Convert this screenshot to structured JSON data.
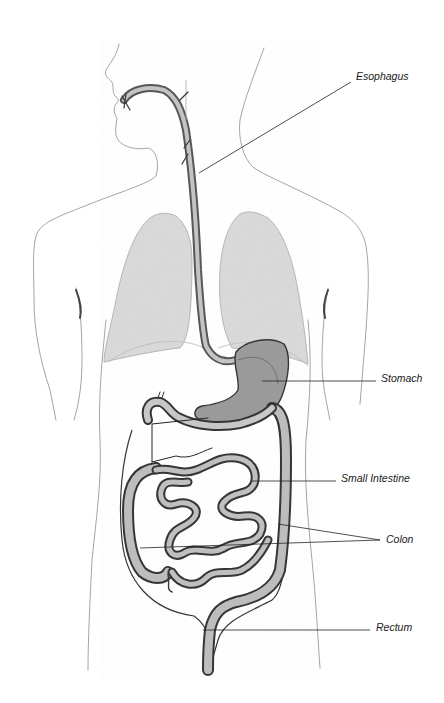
{
  "diagram": {
    "labels": {
      "esophagus": "Esophagus",
      "stomach": "Stomach",
      "small_intestine": "Small Intestine",
      "colon": "Colon",
      "rectum": "Rectum"
    }
  }
}
